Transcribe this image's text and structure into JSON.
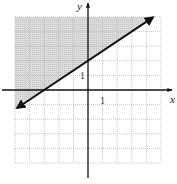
{
  "chart_data": {
    "type": "line",
    "title": "",
    "xlabel": "x",
    "ylabel": "y",
    "xlim": [
      -5,
      5
    ],
    "ylim": [
      -5,
      5
    ],
    "grid": true,
    "grid_step": 1,
    "tick_labels": {
      "x": "1",
      "y": "1"
    },
    "boundary_line": {
      "slope": 0.6667,
      "intercept": 2,
      "style": "solid",
      "arrows": "both",
      "points": [
        [
          -4.85,
          -1.23
        ],
        [
          4.45,
          4.97
        ]
      ]
    },
    "x_intercept": -3,
    "y_intercept": 2,
    "shaded_region": "above",
    "shade_color": "#d4d4d4",
    "grid_color": "#b8b8b8",
    "axis_color": "#111111"
  }
}
